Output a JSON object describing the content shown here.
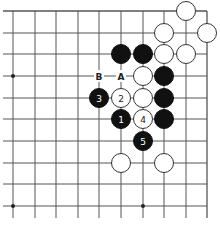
{
  "diagram": {
    "type": "go-board-corner",
    "grid": {
      "cols_x": [
        13,
        35,
        56,
        78,
        99,
        121,
        143,
        164,
        186,
        207
      ],
      "rows_y": [
        11,
        33,
        54,
        76,
        98,
        119,
        141,
        163,
        184,
        206
      ],
      "top_edge": true,
      "right_edge": true,
      "line_color": "#555555",
      "stone_radius": 9.5
    },
    "star_points": [
      {
        "col": 0,
        "row": 3
      },
      {
        "col": 0,
        "row": 9
      },
      {
        "col": 6,
        "row": 9
      }
    ],
    "stones": [
      {
        "col": 8,
        "row": 0,
        "color": "white",
        "label": ""
      },
      {
        "col": 7,
        "row": 1,
        "color": "white",
        "label": ""
      },
      {
        "col": 9,
        "row": 1,
        "color": "white",
        "label": ""
      },
      {
        "col": 5,
        "row": 2,
        "color": "black",
        "label": ""
      },
      {
        "col": 6,
        "row": 2,
        "color": "black",
        "label": ""
      },
      {
        "col": 7,
        "row": 2,
        "color": "white",
        "label": ""
      },
      {
        "col": 8,
        "row": 2,
        "color": "white",
        "label": ""
      },
      {
        "col": 6,
        "row": 3,
        "color": "white",
        "label": ""
      },
      {
        "col": 7,
        "row": 3,
        "color": "black",
        "label": ""
      },
      {
        "col": 4,
        "row": 4,
        "color": "black",
        "label": "3"
      },
      {
        "col": 5,
        "row": 4,
        "color": "white",
        "label": "2"
      },
      {
        "col": 6,
        "row": 4,
        "color": "white",
        "label": ""
      },
      {
        "col": 7,
        "row": 4,
        "color": "black",
        "label": ""
      },
      {
        "col": 5,
        "row": 5,
        "color": "black",
        "label": "1"
      },
      {
        "col": 6,
        "row": 5,
        "color": "white",
        "label": "4"
      },
      {
        "col": 7,
        "row": 5,
        "color": "black",
        "label": ""
      },
      {
        "col": 6,
        "row": 6,
        "color": "black",
        "label": "5"
      },
      {
        "col": 5,
        "row": 7,
        "color": "white",
        "label": ""
      },
      {
        "col": 7,
        "row": 7,
        "color": "white",
        "label": ""
      }
    ],
    "point_labels": [
      {
        "col": 4,
        "row": 3,
        "text": "B"
      },
      {
        "col": 5,
        "row": 3,
        "text": "A"
      }
    ]
  }
}
